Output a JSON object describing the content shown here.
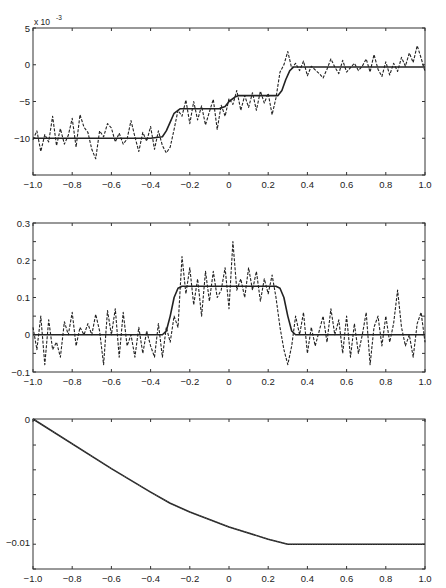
{
  "chart_data": [
    {
      "type": "line",
      "title": "",
      "xlabel": "",
      "ylabel": "",
      "y_scale_annotation": "x 10^-3",
      "xlim": [
        -1.0,
        1.0
      ],
      "ylim": [
        -15,
        5
      ],
      "xticks": [
        "-1.0",
        "-0.8",
        "-0.6",
        "-0.4",
        "-0.2",
        "0",
        "0.2",
        "0.4",
        "0.6",
        "0.8",
        "1.0"
      ],
      "yticks": [
        "5",
        "0",
        "-5",
        "-10"
      ],
      "grid": false,
      "legend": null,
      "series": [
        {
          "name": "smooth (solid)",
          "style": "solid",
          "x": [
            -1.0,
            -0.4,
            -0.34,
            -0.32,
            -0.3,
            -0.28,
            -0.25,
            -0.05,
            -0.02,
            0.0,
            0.03,
            0.05,
            0.25,
            0.27,
            0.29,
            0.31,
            0.33,
            1.0
          ],
          "y": [
            -10,
            -10,
            -9.8,
            -9.0,
            -7.8,
            -6.6,
            -6.0,
            -6.0,
            -5.7,
            -5.0,
            -4.4,
            -4.2,
            -4.2,
            -3.5,
            -2.0,
            -0.8,
            -0.3,
            -0.3
          ]
        },
        {
          "name": "noisy (dashed)",
          "style": "dashed",
          "x": [
            -1.0,
            -0.98,
            -0.96,
            -0.94,
            -0.92,
            -0.9,
            -0.88,
            -0.86,
            -0.84,
            -0.82,
            -0.8,
            -0.78,
            -0.76,
            -0.74,
            -0.72,
            -0.7,
            -0.68,
            -0.66,
            -0.64,
            -0.62,
            -0.6,
            -0.58,
            -0.56,
            -0.54,
            -0.52,
            -0.5,
            -0.48,
            -0.46,
            -0.44,
            -0.42,
            -0.4,
            -0.38,
            -0.36,
            -0.34,
            -0.32,
            -0.3,
            -0.28,
            -0.26,
            -0.24,
            -0.22,
            -0.2,
            -0.18,
            -0.16,
            -0.14,
            -0.12,
            -0.1,
            -0.08,
            -0.06,
            -0.04,
            -0.02,
            0.0,
            0.02,
            0.04,
            0.06,
            0.08,
            0.1,
            0.12,
            0.14,
            0.16,
            0.18,
            0.2,
            0.22,
            0.24,
            0.26,
            0.28,
            0.3,
            0.32,
            0.34,
            0.36,
            0.38,
            0.4,
            0.42,
            0.44,
            0.46,
            0.48,
            0.5,
            0.52,
            0.54,
            0.56,
            0.58,
            0.6,
            0.62,
            0.64,
            0.66,
            0.68,
            0.7,
            0.72,
            0.74,
            0.76,
            0.78,
            0.8,
            0.82,
            0.84,
            0.86,
            0.88,
            0.9,
            0.92,
            0.94,
            0.96,
            0.98,
            1.0
          ],
          "y": [
            -10.2,
            -9.0,
            -11.8,
            -9.5,
            -10.5,
            -7.0,
            -11.0,
            -8.7,
            -10.8,
            -9.6,
            -7.3,
            -11.2,
            -6.8,
            -8.5,
            -9.2,
            -11.5,
            -12.8,
            -9.0,
            -9.8,
            -8.0,
            -8.6,
            -10.5,
            -9.3,
            -10.8,
            -10.1,
            -7.6,
            -9.8,
            -11.8,
            -9.2,
            -10.4,
            -8.4,
            -11.5,
            -9.0,
            -11.0,
            -12.0,
            -11.2,
            -8.8,
            -6.2,
            -7.0,
            -4.8,
            -8.0,
            -5.0,
            -7.5,
            -5.6,
            -8.2,
            -6.4,
            -4.7,
            -8.8,
            -5.5,
            -7.0,
            -4.6,
            -5.4,
            -3.5,
            -6.2,
            -4.2,
            -5.8,
            -3.8,
            -6.2,
            -3.6,
            -5.2,
            -3.9,
            -6.8,
            -4.5,
            -1.0,
            0.0,
            1.8,
            -0.5,
            0.2,
            -0.8,
            0.5,
            -1.5,
            -0.2,
            -0.7,
            -1.2,
            -1.8,
            -0.6,
            0.8,
            -0.3,
            -1.2,
            0.6,
            -1.0,
            -0.4,
            0.2,
            -0.8,
            -0.2,
            0.8,
            -1.0,
            1.4,
            -0.6,
            -1.6,
            0.4,
            -1.4,
            0.2,
            -0.9,
            1.0,
            -0.2,
            1.6,
            0.3,
            2.6,
            0.9,
            -0.9
          ]
        }
      ]
    },
    {
      "type": "line",
      "title": "",
      "xlabel": "",
      "ylabel": "",
      "xlim": [
        -1.0,
        1.0
      ],
      "ylim": [
        -0.1,
        0.3
      ],
      "xticks": [
        "-1.0",
        "-0.8",
        "-0.6",
        "-0.4",
        "-0.2",
        "0",
        "0.2",
        "0.4",
        "0.6",
        "0.8",
        "1.0"
      ],
      "yticks": [
        "0.3",
        "0.2",
        "0.1",
        "0",
        "-0.1"
      ],
      "grid": false,
      "legend": null,
      "series": [
        {
          "name": "smooth (solid)",
          "style": "solid",
          "x": [
            -1.0,
            -0.34,
            -0.32,
            -0.3,
            -0.28,
            -0.26,
            -0.24,
            0.24,
            0.26,
            0.28,
            0.3,
            0.32,
            0.34,
            1.0
          ],
          "y": [
            0.0,
            0.0,
            0.01,
            0.05,
            0.1,
            0.125,
            0.13,
            0.13,
            0.125,
            0.1,
            0.05,
            0.01,
            0.0,
            0.0
          ]
        },
        {
          "name": "noisy (dashed)",
          "style": "dashed",
          "x": [
            -1.0,
            -0.98,
            -0.96,
            -0.94,
            -0.92,
            -0.9,
            -0.88,
            -0.86,
            -0.84,
            -0.82,
            -0.8,
            -0.78,
            -0.76,
            -0.74,
            -0.72,
            -0.7,
            -0.68,
            -0.66,
            -0.64,
            -0.62,
            -0.6,
            -0.58,
            -0.56,
            -0.54,
            -0.52,
            -0.5,
            -0.48,
            -0.46,
            -0.44,
            -0.42,
            -0.4,
            -0.38,
            -0.36,
            -0.34,
            -0.32,
            -0.3,
            -0.28,
            -0.26,
            -0.24,
            -0.22,
            -0.2,
            -0.18,
            -0.16,
            -0.14,
            -0.12,
            -0.1,
            -0.08,
            -0.06,
            -0.04,
            -0.02,
            0.0,
            0.02,
            0.04,
            0.06,
            0.08,
            0.1,
            0.12,
            0.14,
            0.16,
            0.18,
            0.2,
            0.22,
            0.24,
            0.26,
            0.28,
            0.3,
            0.32,
            0.34,
            0.36,
            0.38,
            0.4,
            0.42,
            0.44,
            0.46,
            0.48,
            0.5,
            0.52,
            0.54,
            0.56,
            0.58,
            0.6,
            0.62,
            0.64,
            0.66,
            0.68,
            0.7,
            0.72,
            0.74,
            0.76,
            0.78,
            0.8,
            0.82,
            0.84,
            0.86,
            0.88,
            0.9,
            0.92,
            0.94,
            0.96,
            0.98,
            1.0
          ],
          "y": [
            0.02,
            -0.04,
            0.05,
            -0.08,
            0.04,
            -0.04,
            -0.02,
            -0.06,
            0.035,
            0.0,
            0.06,
            -0.03,
            0.02,
            0.0,
            0.03,
            0.0,
            0.055,
            0.01,
            -0.08,
            0.065,
            0.0,
            0.07,
            -0.06,
            0.06,
            -0.03,
            0.0,
            -0.06,
            0.02,
            -0.05,
            0.01,
            -0.03,
            -0.06,
            0.03,
            -0.06,
            0.02,
            -0.02,
            0.05,
            0.02,
            0.21,
            0.11,
            0.18,
            0.08,
            0.15,
            0.05,
            0.17,
            0.09,
            0.17,
            0.1,
            0.12,
            0.18,
            0.07,
            0.25,
            0.12,
            0.15,
            0.1,
            0.18,
            0.12,
            0.17,
            0.09,
            0.15,
            0.11,
            0.16,
            0.1,
            0.02,
            -0.04,
            -0.08,
            -0.03,
            0.05,
            0.0,
            0.06,
            -0.05,
            0.02,
            -0.03,
            0.01,
            0.05,
            -0.02,
            0.07,
            0.0,
            0.04,
            -0.05,
            0.05,
            -0.06,
            0.03,
            -0.05,
            0.0,
            0.06,
            -0.08,
            0.02,
            0.05,
            -0.03,
            0.05,
            -0.02,
            0.03,
            0.12,
            0.02,
            -0.03,
            0.0,
            -0.06,
            0.03,
            0.06,
            -0.02
          ]
        }
      ]
    },
    {
      "type": "line",
      "title": "",
      "xlabel": "",
      "ylabel": "",
      "xlim": [
        -1.0,
        1.0
      ],
      "ylim": [
        -0.0121,
        0.0
      ],
      "xticks": [
        "-1.0",
        "-0.8",
        "-0.6",
        "-0.4",
        "-0.2",
        "0",
        "0.2",
        "0.4",
        "0.6",
        "0.8",
        "1.0"
      ],
      "yticks": [
        "0",
        "-0.01"
      ],
      "grid": false,
      "legend": null,
      "series": [
        {
          "name": "solid",
          "style": "solid",
          "x": [
            -1.0,
            -0.6,
            -0.4,
            -0.3,
            -0.2,
            0.0,
            0.2,
            0.3,
            1.0
          ],
          "y": [
            0.0,
            -0.004,
            -0.0059,
            -0.0068,
            -0.0075,
            -0.0087,
            -0.0097,
            -0.0101,
            -0.0101
          ]
        },
        {
          "name": "dotted",
          "style": "dotted",
          "x": [
            -1.0,
            -0.6,
            -0.4,
            -0.3,
            -0.2,
            0.0,
            0.2,
            0.3,
            1.0
          ],
          "y": [
            0.0,
            -0.004,
            -0.0059,
            -0.0068,
            -0.0075,
            -0.0087,
            -0.0097,
            -0.0101,
            -0.0101
          ]
        }
      ]
    }
  ],
  "panels": [
    {
      "id": "top",
      "exp_label": "x 10",
      "exp_sup": "-3"
    },
    {
      "id": "middle"
    },
    {
      "id": "bottom"
    }
  ]
}
